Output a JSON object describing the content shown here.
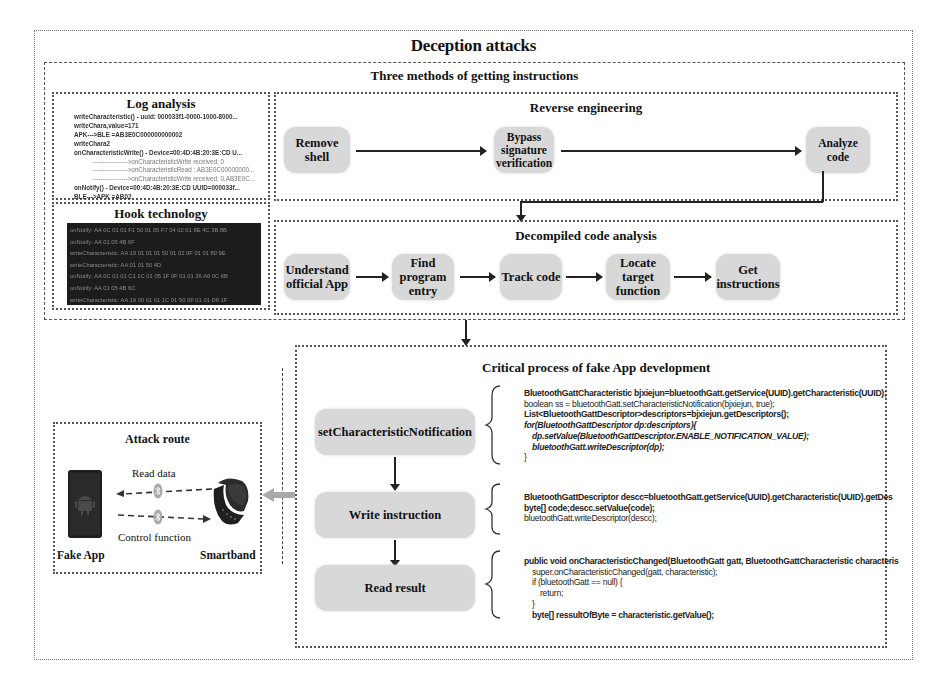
{
  "title": "Deception attacks",
  "three_methods": {
    "title": "Three methods of getting instructions",
    "log_analysis": {
      "title": "Log analysis",
      "lines": [
        {
          "text": "writeCharacteristic() - uuid: 000033f1-0000-1000-8000...",
          "style": "bold"
        },
        {
          "text": "writeChara,value=171",
          "style": "bold"
        },
        {
          "text": "APK--->BLE  =AB3E0C000000000002",
          "style": "bold"
        },
        {
          "text": "writeChara2",
          "style": "bold"
        },
        {
          "text": "onCharacteristicWrite() - Device=00:4D:4B:20:3E:CD U...",
          "style": "bold"
        },
        {
          "text": "----------------->onCharacteristicWrite received: 0",
          "style": "ind"
        },
        {
          "text": "----------------->onCharacteristicRead : AB3E0C00000000...",
          "style": "ind"
        },
        {
          "text": "----------------->onCharacteristicWrite received: 0,AB3E0C...",
          "style": "ind"
        },
        {
          "text": "onNotify() - Device=00:4D:4B:20:3E:CD UUID=000033f...",
          "style": "bold"
        },
        {
          "text": "BLE--->APK =AB02",
          "style": "bold"
        }
      ]
    },
    "hook_technology": {
      "title": "Hook technology",
      "lines": [
        "onNotify: AA 0C 01 01 F1 50 01 05 F7 04 02 01 8E 4C 3B 8B",
        "onNotify: AA 01 05 4B 6F",
        "writeCharacteristic: AA 19 01 01 01 50 01 02 0F 01 01 80 9E",
        "writeCharacteristic: AA 01 01 50 4D",
        "onNotify: AA 0C 01 01 C1 1C 01 05 1F 0F 01 01 36 A6 0C 6B",
        "onNotify: AA 01 05 4B 6C",
        "writeCharacteristic: AA 19 00 01 01 1C 01 50 0F 01 01 D8 1F"
      ]
    },
    "reverse_engineering": {
      "title": "Reverse engineering",
      "steps": [
        "Remove shell",
        "Bypass signature verification",
        "Analyze code"
      ]
    },
    "decompiled_code_analysis": {
      "title": "Decompiled code analysis",
      "steps": [
        "Understand official App",
        "Find program entry",
        "Track code",
        "Locate target function",
        "Get instructions"
      ]
    }
  },
  "critical_process": {
    "title": "Critical process of fake App development",
    "steps": [
      "setCharacteristicNotification",
      "Write  instruction",
      "Read result"
    ],
    "code_blocks": [
      [
        "BluetoothGattCharacteristic bjxiejun=bluetoothGatt.getService(UUID).getCharacteristic(UUID);",
        "boolean ss = bluetoothGatt.setCharacteristicNotification(bjxiejun, true);",
        "List<BluetoothGattDescriptor>descriptors=bjxiejun.getDescriptors();",
        "for(BluetoothGattDescriptor dp:descriptors){",
        "   dp.setValue(BluetoothGattDescriptor.ENABLE_NOTIFICATION_VALUE);",
        "   bluetoothGatt.writeDescriptor(dp);",
        "}"
      ],
      [
        "BluetoothGattDescriptor descc=bluetoothGatt.getService(UUID).getCharacteristic(UUID).getDes",
        "byte[] code;descc.setValue(code);",
        "bluetoothGatt.writeDescriptor(descc);"
      ],
      [
        "public void onCharacteristicChanged(BluetoothGatt gatt, BluetoothGattCharacteristic characteris",
        "   super.onCharacteristicChanged(gatt, characteristic);",
        "   if (bluetoothGatt == null) {",
        "      return;",
        "   }",
        "   byte[] ressultOfByte = characteristic.getValue();"
      ]
    ]
  },
  "attack_route": {
    "title": "Attack route",
    "read_label": "Read data",
    "control_label": "Control function",
    "left_device": "Fake App",
    "right_device": "Smartband",
    "icons": [
      "android-phone-icon",
      "bluetooth-icon",
      "smartband-icon"
    ]
  },
  "colors": {
    "step_fill": "#d8d8d8",
    "terminal_bg": "#1c1c1c",
    "border": "#555555",
    "code_keyword": "#666666",
    "grey_arrow": "#a9a9a9"
  }
}
